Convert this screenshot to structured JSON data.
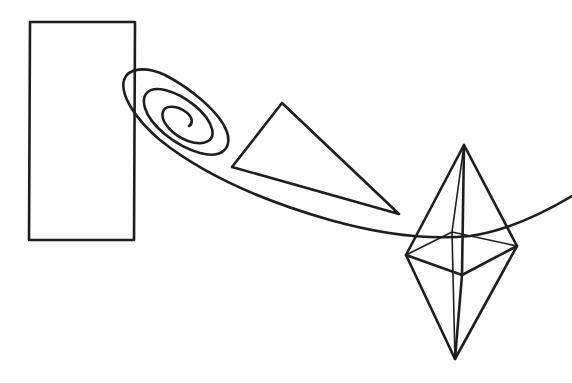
{
  "figure": {
    "description": "Black line drawing of geometric shapes connected by a spiral curve",
    "stroke_color": "#1e1e1e",
    "background_color": "#fdfdfd",
    "shapes": [
      {
        "name": "rectangle",
        "label": "Rectangle"
      },
      {
        "name": "spiral",
        "label": "Spiral curve"
      },
      {
        "name": "triangle",
        "label": "Triangle"
      },
      {
        "name": "octahedron",
        "label": "Octahedron (double pyramid)"
      }
    ]
  }
}
